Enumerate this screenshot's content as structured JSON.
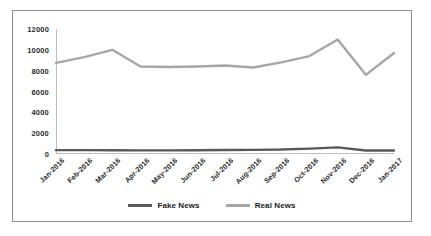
{
  "chart_data": {
    "type": "line",
    "title": "",
    "xlabel": "",
    "ylabel": "",
    "ylim": [
      0,
      12000
    ],
    "ytick_labels": [
      "0",
      "2000",
      "4000",
      "6000",
      "8000",
      "10000",
      "12000"
    ],
    "ytick_values": [
      0,
      2000,
      4000,
      6000,
      8000,
      10000,
      12000
    ],
    "grid": false,
    "legend_position": "bottom",
    "categories": [
      "Jan-2016",
      "Feb-2016",
      "Mar-2016",
      "Apr-2016",
      "May-2016",
      "Jun-2016",
      "Jul-2016",
      "Aug-2016",
      "Sep-2016",
      "Oct-2016",
      "Nov-2016",
      "Dec-2016",
      "Jan-2017"
    ],
    "series": [
      {
        "name": "Fake News",
        "color": "#595959",
        "values": [
          370,
          370,
          360,
          350,
          350,
          360,
          380,
          400,
          430,
          520,
          640,
          330,
          330
        ]
      },
      {
        "name": "Real News",
        "color": "#a6a6a6",
        "values": [
          8750,
          9300,
          10000,
          8400,
          8350,
          8400,
          8500,
          8300,
          8800,
          9400,
          11000,
          7600,
          9700
        ]
      }
    ]
  },
  "legend": {
    "items": [
      {
        "label": "Fake News",
        "color": "#595959"
      },
      {
        "label": "Real News",
        "color": "#a6a6a6"
      }
    ]
  },
  "figure": {
    "border_color": "#8c8c8c",
    "axis_color": "#bfbfbf",
    "background": "#ffffff"
  }
}
